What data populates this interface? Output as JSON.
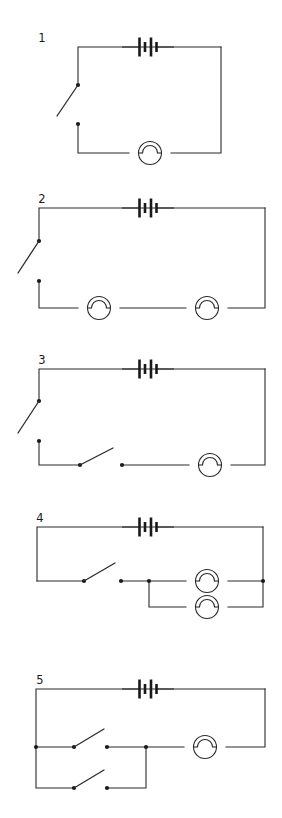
{
  "document": {
    "title": "Circuit Diagrams 1-5",
    "background_color": "#ffffff",
    "ink_color": "#2b2b2b",
    "width": 282,
    "height": 818
  },
  "legend": {
    "battery_symbol": "battery-symbol",
    "lamp_symbol": "lamp-symbol",
    "switch_symbol": "open-switch-symbol",
    "node_symbol": "junction-dot"
  },
  "circuits": [
    {
      "id": 1,
      "label": "1",
      "label_x": 42,
      "label_y": 42,
      "description": "Single loop: battery top, open switch left, one lamp bottom",
      "components": {
        "battery": {
          "x": 148,
          "y": 47
        },
        "lamps": [
          {
            "x": 150,
            "y": 153
          }
        ],
        "switches": [
          {
            "type": "vertical",
            "pivot_x": 78,
            "pivot_y": 85,
            "open_x": 57,
            "open_y": 116,
            "contact_x": 78,
            "contact_y": 124
          }
        ]
      },
      "wires": [
        "M78,85 L78,47 L221,47",
        "M221,47 L221,153 L171,153",
        "M78,124 L78,153 L129,153"
      ]
    },
    {
      "id": 2,
      "label": "2",
      "label_x": 42,
      "label_y": 203,
      "description": "Single loop: battery top, open switch left, two lamps in series bottom",
      "components": {
        "battery": {
          "x": 148,
          "y": 208
        },
        "lamps": [
          {
            "x": 99,
            "y": 308
          },
          {
            "x": 207,
            "y": 308
          }
        ],
        "switches": [
          {
            "type": "vertical",
            "pivot_x": 39,
            "pivot_y": 241,
            "open_x": 18,
            "open_y": 273,
            "contact_x": 39,
            "contact_y": 281
          }
        ]
      },
      "wires": [
        "M39,241 L39,208 L265,208",
        "M265,208 L265,308 L228,308",
        "M39,281 L39,308 L78,308",
        "M120,308 L186,308"
      ]
    },
    {
      "id": 3,
      "label": "3",
      "label_x": 42,
      "label_y": 364,
      "description": "Single loop: battery top, open switch left, open switch in bottom wire, one lamp bottom right",
      "components": {
        "battery": {
          "x": 148,
          "y": 369
        },
        "lamps": [
          {
            "x": 210,
            "y": 465
          }
        ],
        "switches": [
          {
            "type": "vertical",
            "pivot_x": 39,
            "pivot_y": 401,
            "open_x": 18,
            "open_y": 433,
            "contact_x": 39,
            "contact_y": 441
          },
          {
            "type": "horizontal",
            "pivot_x": 80,
            "pivot_y": 465,
            "open_x": 113,
            "open_y": 448,
            "contact_x": 122,
            "contact_y": 465
          }
        ]
      },
      "wires": [
        "M39,401 L39,369 L265,369",
        "M265,369 L265,465 L231,465",
        "M39,441 L39,465 L80,465",
        "M122,465 L189,465"
      ]
    },
    {
      "id": 4,
      "label": "4",
      "label_x": 40,
      "label_y": 522,
      "description": "Battery top, open switch in bottom wire, two lamps in parallel right",
      "components": {
        "battery": {
          "x": 148,
          "y": 527
        },
        "lamps": [
          {
            "x": 207,
            "y": 581
          },
          {
            "x": 207,
            "y": 607
          }
        ],
        "switches": [
          {
            "type": "horizontal",
            "pivot_x": 84,
            "pivot_y": 581,
            "open_x": 115,
            "open_y": 563,
            "contact_x": 121,
            "contact_y": 581
          }
        ]
      },
      "nodes": [
        {
          "x": 149,
          "y": 581
        },
        {
          "x": 263,
          "y": 581
        }
      ],
      "wires": [
        "M37,581 L37,527 L263,527",
        "M263,527 L263,581",
        "M37,581 L84,581",
        "M121,581 L186,581",
        "M228,581 L263,581",
        "M149,581 L149,607 L186,607",
        "M228,607 L263,607 L263,581"
      ]
    },
    {
      "id": 5,
      "label": "5",
      "label_x": 40,
      "label_y": 684,
      "description": "Battery top, one lamp right, two open switches in parallel left",
      "components": {
        "battery": {
          "x": 148,
          "y": 689
        },
        "lamps": [
          {
            "x": 205,
            "y": 747
          }
        ],
        "switches": [
          {
            "type": "horizontal",
            "pivot_x": 74,
            "pivot_y": 747,
            "open_x": 104,
            "open_y": 729,
            "contact_x": 107,
            "contact_y": 747
          },
          {
            "type": "horizontal",
            "pivot_x": 74,
            "pivot_y": 788,
            "open_x": 104,
            "open_y": 770,
            "contact_x": 107,
            "contact_y": 788
          }
        ]
      },
      "nodes": [
        {
          "x": 36,
          "y": 747
        },
        {
          "x": 146,
          "y": 747
        }
      ],
      "wires": [
        "M36,747 L36,689 L265,689",
        "M265,689 L265,747 L226,747",
        "M36,747 L74,747",
        "M107,747 L184,747",
        "M36,747 L36,788 L74,788",
        "M107,788 L146,788 L146,747"
      ]
    }
  ],
  "symbols": {
    "battery": {
      "name": "battery-symbol",
      "lead_length": 17,
      "plates": [
        {
          "dx": -8.5,
          "half_height": 9.5
        },
        {
          "dx": -3.0,
          "half_height": 5.0
        },
        {
          "dx": 3.0,
          "half_height": 9.5
        },
        {
          "dx": 8.5,
          "half_height": 5.0
        }
      ]
    },
    "lamp": {
      "name": "lamp-symbol",
      "radius": 11.5,
      "arc_radius": 7.5
    },
    "switch": {
      "name": "open-switch-symbol",
      "dot_radius": 2.1
    }
  }
}
